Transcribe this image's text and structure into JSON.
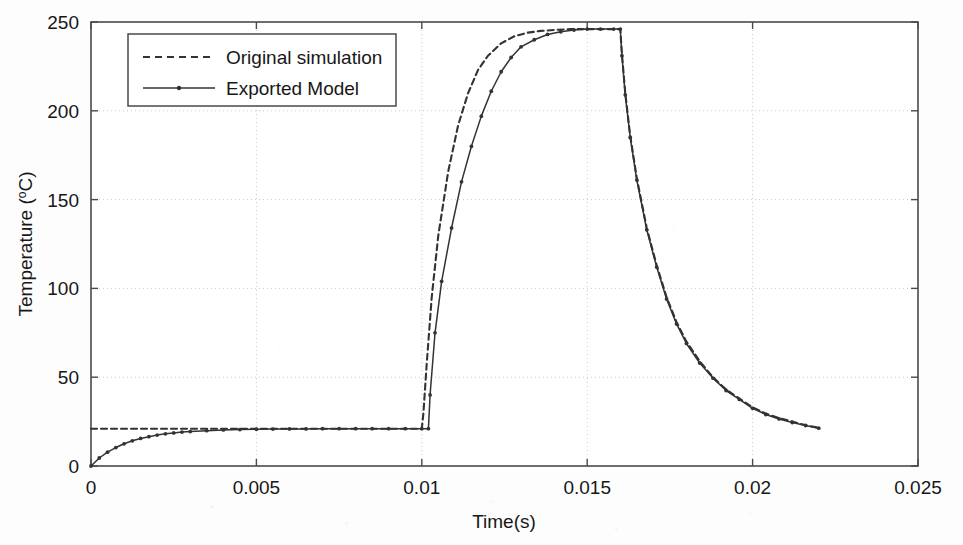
{
  "chart_data": {
    "type": "line",
    "title": "",
    "subtitle": "",
    "xlabel": "Time(s)",
    "ylabel": "Temperature (ºC)",
    "ylabel_main": "Temperature (",
    "ylabel_unit_sup": "o",
    "ylabel_unit_rest": "C)",
    "xlim": [
      0,
      0.025
    ],
    "ylim": [
      0,
      250
    ],
    "xticks": [
      0,
      0.005,
      0.01,
      0.015,
      0.02,
      0.025
    ],
    "xtick_labels": [
      "0",
      "0.005",
      "0.01",
      "0.015",
      "0.02",
      "0.025"
    ],
    "yticks": [
      0,
      50,
      100,
      150,
      200,
      250
    ],
    "ytick_labels": [
      "0",
      "50",
      "100",
      "150",
      "200",
      "250"
    ],
    "grid": true,
    "grid_style": "dotted",
    "legend_position": "top-left-inside",
    "series": [
      {
        "name": "Original simulation",
        "style": "dashed",
        "color": "#333333",
        "marker": "none",
        "points": [
          [
            0.0,
            21.0
          ],
          [
            0.0005,
            21.0
          ],
          [
            0.001,
            21.0
          ],
          [
            0.0015,
            21.0
          ],
          [
            0.002,
            21.0
          ],
          [
            0.0025,
            21.0
          ],
          [
            0.003,
            21.0
          ],
          [
            0.0035,
            21.0
          ],
          [
            0.004,
            21.0
          ],
          [
            0.0045,
            21.0
          ],
          [
            0.005,
            21.0
          ],
          [
            0.0055,
            21.0
          ],
          [
            0.006,
            21.0
          ],
          [
            0.0065,
            21.0
          ],
          [
            0.007,
            21.0
          ],
          [
            0.0075,
            21.0
          ],
          [
            0.008,
            21.0
          ],
          [
            0.0085,
            21.0
          ],
          [
            0.009,
            21.0
          ],
          [
            0.0095,
            21.0
          ],
          [
            0.01,
            21.0
          ],
          [
            0.01005,
            30.0
          ],
          [
            0.01015,
            58.0
          ],
          [
            0.0103,
            95.0
          ],
          [
            0.0105,
            130.0
          ],
          [
            0.0108,
            166.0
          ],
          [
            0.0111,
            192.0
          ],
          [
            0.0114,
            210.0
          ],
          [
            0.0117,
            223.0
          ],
          [
            0.012,
            231.0
          ],
          [
            0.0124,
            238.0
          ],
          [
            0.0128,
            242.0
          ],
          [
            0.0132,
            244.0
          ],
          [
            0.0136,
            245.0
          ],
          [
            0.014,
            245.5
          ],
          [
            0.0145,
            246.0
          ],
          [
            0.015,
            246.0
          ],
          [
            0.0155,
            246.0
          ],
          [
            0.0159,
            246.0
          ],
          [
            0.016,
            246.0
          ],
          [
            0.01605,
            232.0
          ],
          [
            0.01615,
            210.0
          ],
          [
            0.0163,
            186.0
          ],
          [
            0.0165,
            162.0
          ],
          [
            0.0168,
            134.0
          ],
          [
            0.0171,
            113.0
          ],
          [
            0.0174,
            95.0
          ],
          [
            0.0177,
            81.0
          ],
          [
            0.018,
            70.0
          ],
          [
            0.0184,
            59.0
          ],
          [
            0.0188,
            50.0
          ],
          [
            0.0192,
            43.0
          ],
          [
            0.0196,
            38.0
          ],
          [
            0.02,
            33.0
          ],
          [
            0.0204,
            29.5
          ],
          [
            0.0208,
            27.0
          ],
          [
            0.0212,
            25.0
          ],
          [
            0.0216,
            23.0
          ],
          [
            0.022,
            21.5
          ]
        ]
      },
      {
        "name": "Exported Model",
        "style": "solid",
        "color": "#333333",
        "marker": "dot",
        "points": [
          [
            0.0,
            0.0
          ],
          [
            0.00025,
            4.5
          ],
          [
            0.0005,
            7.8
          ],
          [
            0.00075,
            10.4
          ],
          [
            0.001,
            12.5
          ],
          [
            0.00125,
            14.2
          ],
          [
            0.0015,
            15.5
          ],
          [
            0.00175,
            16.5
          ],
          [
            0.002,
            17.4
          ],
          [
            0.00225,
            18.1
          ],
          [
            0.0025,
            18.6
          ],
          [
            0.00275,
            19.1
          ],
          [
            0.003,
            19.4
          ],
          [
            0.0035,
            19.9
          ],
          [
            0.004,
            20.3
          ],
          [
            0.0045,
            20.5
          ],
          [
            0.005,
            20.7
          ],
          [
            0.0055,
            20.8
          ],
          [
            0.006,
            20.9
          ],
          [
            0.0065,
            20.9
          ],
          [
            0.007,
            21.0
          ],
          [
            0.0075,
            21.0
          ],
          [
            0.008,
            21.0
          ],
          [
            0.0085,
            21.0
          ],
          [
            0.009,
            21.0
          ],
          [
            0.0095,
            21.0
          ],
          [
            0.01,
            21.0
          ],
          [
            0.0102,
            21.0
          ],
          [
            0.01025,
            40.0
          ],
          [
            0.0104,
            75.0
          ],
          [
            0.0106,
            104.0
          ],
          [
            0.0109,
            134.0
          ],
          [
            0.0112,
            160.0
          ],
          [
            0.0115,
            180.0
          ],
          [
            0.0118,
            197.0
          ],
          [
            0.0121,
            211.0
          ],
          [
            0.0124,
            222.0
          ],
          [
            0.0127,
            230.0
          ],
          [
            0.013,
            236.0
          ],
          [
            0.0134,
            240.0
          ],
          [
            0.0138,
            243.0
          ],
          [
            0.0142,
            244.5
          ],
          [
            0.0146,
            245.5
          ],
          [
            0.015,
            246.0
          ],
          [
            0.0154,
            246.0
          ],
          [
            0.0158,
            246.0
          ],
          [
            0.016,
            246.0
          ],
          [
            0.01605,
            231.0
          ],
          [
            0.01615,
            209.0
          ],
          [
            0.0163,
            185.0
          ],
          [
            0.0165,
            161.0
          ],
          [
            0.0168,
            133.0
          ],
          [
            0.0171,
            112.0
          ],
          [
            0.0174,
            94.0
          ],
          [
            0.0177,
            80.0
          ],
          [
            0.018,
            69.0
          ],
          [
            0.0184,
            58.0
          ],
          [
            0.0188,
            49.5
          ],
          [
            0.0192,
            42.5
          ],
          [
            0.0196,
            37.5
          ],
          [
            0.02,
            32.5
          ],
          [
            0.0204,
            29.0
          ],
          [
            0.0208,
            26.5
          ],
          [
            0.0212,
            24.5
          ],
          [
            0.0216,
            22.8
          ],
          [
            0.022,
            21.3
          ]
        ]
      }
    ]
  },
  "legend": {
    "items": [
      {
        "label": "Original simulation",
        "style": "dashed"
      },
      {
        "label": "Exported Model",
        "style": "solid-marker"
      }
    ]
  },
  "colors": {
    "line": "#333333",
    "axis": "#4a4a4a",
    "grid": "#c9c9c9",
    "background": "#fdfdfd",
    "text": "#171717"
  }
}
